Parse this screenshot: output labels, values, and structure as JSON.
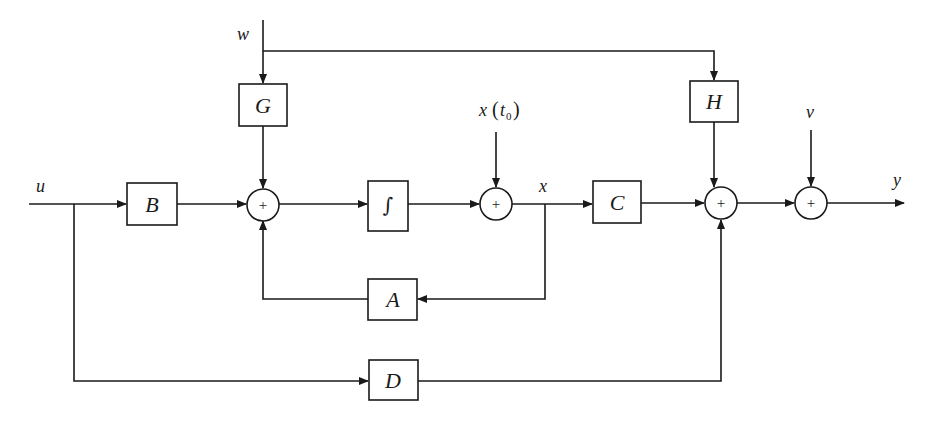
{
  "diagram": {
    "signals": {
      "input": "u",
      "disturbance": "w",
      "initial_state": "x",
      "initial_state_paren_open": "(",
      "initial_state_t": "t",
      "initial_state_sub": "0",
      "initial_state_paren_close": ")",
      "state": "x",
      "noise": "v",
      "output": "y"
    },
    "blocks": {
      "B": "B",
      "G": "G",
      "integrator": "∫",
      "A": "A",
      "C": "C",
      "H": "H",
      "D": "D"
    },
    "summing_junctions": [
      {
        "id": "sum1",
        "sign": "+"
      },
      {
        "id": "sum2",
        "sign": "+"
      },
      {
        "id": "sum3",
        "sign": "+"
      },
      {
        "id": "sum4",
        "sign": "+"
      }
    ],
    "connections": [
      "u → B → sum1",
      "w → G → sum1",
      "w → H → sum3",
      "A → sum1 (feedback)",
      "sum1 → ∫ → sum2",
      "x(t0) → sum2",
      "sum2 → x → C → sum3",
      "x → A",
      "u → D → sum3",
      "sum3 → sum4",
      "v → sum4",
      "sum4 → y"
    ],
    "colors": {
      "line": "#1a1a1a",
      "background": "#ffffff"
    }
  }
}
